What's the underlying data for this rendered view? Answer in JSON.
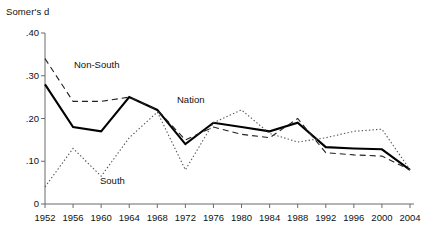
{
  "chart_data": {
    "type": "line",
    "title": "",
    "xlabel": "",
    "ylabel": "Somer's d",
    "ylim": [
      0,
      0.4
    ],
    "yticks": [
      "0",
      ".10",
      ".20",
      ".30",
      ".40"
    ],
    "ytick_values": [
      0,
      0.1,
      0.2,
      0.3,
      0.4
    ],
    "grid": false,
    "legend": "inline-annotations",
    "categories": [
      1952,
      1956,
      1960,
      1964,
      1968,
      1972,
      1976,
      1980,
      1984,
      1988,
      1992,
      1996,
      2000,
      2004
    ],
    "xtick_labels": [
      "1952",
      "1956",
      "1960",
      "1964",
      "1968",
      "1972",
      "1976",
      "1980",
      "1984",
      "1988",
      "1992",
      "1996",
      "2000",
      "2004"
    ],
    "series": [
      {
        "name": "Nation",
        "style": "solid",
        "color": "#000000",
        "width": 2.1,
        "values": [
          0.28,
          0.18,
          0.17,
          0.25,
          0.22,
          0.14,
          0.19,
          0.18,
          0.17,
          0.19,
          0.133,
          0.13,
          0.128,
          0.08
        ]
      },
      {
        "name": "Non-South",
        "style": "dashed",
        "color": "#222222",
        "width": 1.1,
        "values": [
          0.34,
          0.24,
          0.24,
          0.25,
          0.22,
          0.15,
          0.18,
          0.163,
          0.155,
          0.2,
          0.12,
          0.115,
          0.112,
          0.08
        ]
      },
      {
        "name": "South",
        "style": "dotted",
        "color": "#555555",
        "width": 1.1,
        "values": [
          0.04,
          0.13,
          0.065,
          0.155,
          0.215,
          0.08,
          0.19,
          0.22,
          0.165,
          0.145,
          0.155,
          0.17,
          0.175,
          0.08
        ]
      }
    ],
    "annotations": [
      {
        "text": "Non-South",
        "x_px": 74,
        "y_px": 59
      },
      {
        "text": "South",
        "x_px": 100,
        "y_px": 175
      },
      {
        "text": "Nation",
        "x_px": 177,
        "y_px": 94
      }
    ]
  },
  "axes": {
    "plot_left": 45,
    "plot_right": 410,
    "plot_top": 33,
    "plot_bottom": 204
  }
}
